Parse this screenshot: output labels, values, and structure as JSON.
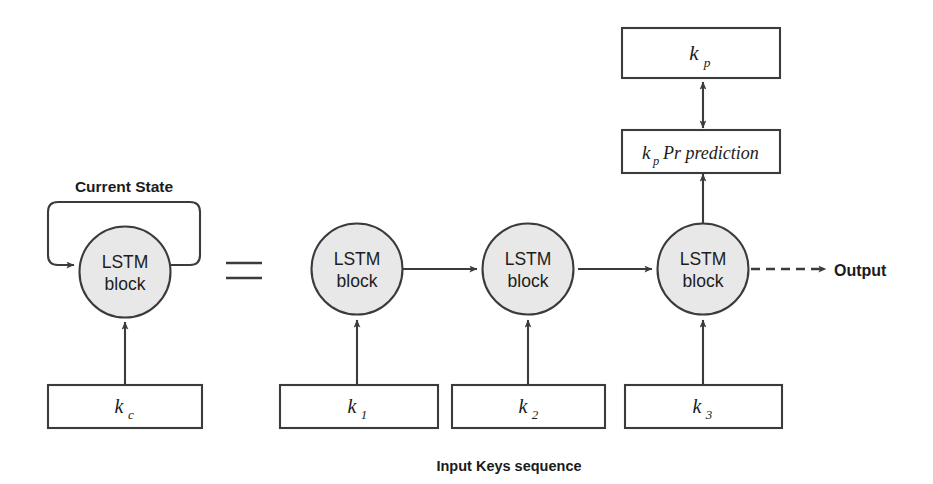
{
  "figure": {
    "title_caption": "Input Keys sequence",
    "current_state_label": "Current State",
    "output_label": "Output",
    "equals_symbol": "=",
    "colors": {
      "circle_fill": "#e8e8e8",
      "stroke": "#3b3b3b",
      "text": "#1c1c1c",
      "background": "#ffffff"
    }
  },
  "left_unit": {
    "circle_label_line1": "LSTM",
    "circle_label_line2": "block",
    "input_box_label": "k",
    "input_box_subscript": "c",
    "recurrent_label": "Current State"
  },
  "unrolled": {
    "blocks": [
      {
        "label_line1": "LSTM",
        "label_line2": "block"
      },
      {
        "label_line1": "LSTM",
        "label_line2": "block"
      },
      {
        "label_line1": "LSTM",
        "label_line2": "block"
      }
    ],
    "input_boxes": [
      {
        "label": "k",
        "subscript": "1"
      },
      {
        "label": "k",
        "subscript": "2"
      },
      {
        "label": "k",
        "subscript": "3"
      }
    ]
  },
  "prediction_stack": {
    "top_box": {
      "label": "k",
      "subscript": "p"
    },
    "bottom_box": {
      "label": "k",
      "subscript": "p",
      "suffix": "Pr prediction"
    }
  }
}
